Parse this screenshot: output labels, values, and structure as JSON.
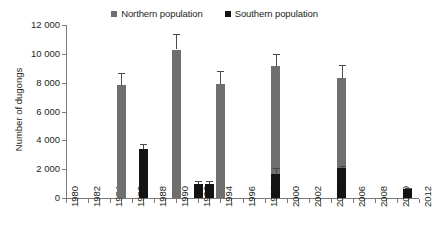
{
  "legend": {
    "items": [
      {
        "label": "Northern population",
        "color": "#6f6f6f",
        "marker": "square-marker"
      },
      {
        "label": "Southern population",
        "color": "#131313",
        "marker": "square-marker"
      }
    ]
  },
  "axes": {
    "ylabel": "Number of dugongs",
    "yticks": [
      "0",
      "2 000",
      "4 000",
      "6 000",
      "8 000",
      "10 000",
      "12 000"
    ],
    "xticks": [
      "1980",
      "1982",
      "1984",
      "1986",
      "1988",
      "1990",
      "1992",
      "1994",
      "1996",
      "1998",
      "2000",
      "2002",
      "2004",
      "2006",
      "2008",
      "2010",
      "2012"
    ]
  },
  "chart_data": {
    "type": "bar",
    "title": "",
    "subtitle": "",
    "xlabel": "",
    "ylabel": "Number of dugongs",
    "xlim": [
      1980,
      2012
    ],
    "ylim": [
      0,
      12000
    ],
    "ytick_values": [
      0,
      2000,
      4000,
      6000,
      8000,
      10000,
      12000
    ],
    "xtick_values": [
      1980,
      1982,
      1984,
      1986,
      1988,
      1990,
      1992,
      1994,
      1996,
      1998,
      2000,
      2002,
      2004,
      2006,
      2008,
      2010,
      2012
    ],
    "grid": false,
    "legend_position": "top-center",
    "error_bars": "symmetric standard error",
    "series": [
      {
        "name": "Northern population",
        "color": "#6f6f6f",
        "points": [
          {
            "x": 1985,
            "value": 7850,
            "error": 800
          },
          {
            "x": 1990,
            "value": 10300,
            "error": 1100
          },
          {
            "x": 1994,
            "value": 7900,
            "error": 900
          },
          {
            "x": 1999,
            "value": 9150,
            "error": 850
          },
          {
            "x": 2005,
            "value": 8300,
            "error": 950
          }
        ]
      },
      {
        "name": "Southern population",
        "color": "#131313",
        "points": [
          {
            "x": 1987,
            "value": 3400,
            "error": 350
          },
          {
            "x": 1992,
            "value": 1000,
            "error": 200
          },
          {
            "x": 1993,
            "value": 980,
            "error": 220
          },
          {
            "x": 1999,
            "value": 1700,
            "error": 380
          },
          {
            "x": 2005,
            "value": 2050,
            "error": 200
          },
          {
            "x": 2011,
            "value": 620,
            "error": 90
          }
        ]
      }
    ]
  }
}
